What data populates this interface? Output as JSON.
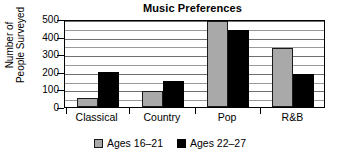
{
  "chart_data": {
    "type": "bar",
    "title": "Music Preferences",
    "xlabel": "",
    "ylabel": "Number of\nPeople Surveyed",
    "categories": [
      "Classical",
      "Country",
      "Pop",
      "R&B"
    ],
    "series": [
      {
        "name": "Ages 16–21",
        "color": "#a9a9a9",
        "values": [
          50,
          90,
          490,
          335
        ]
      },
      {
        "name": "Ages 22–27",
        "color": "#000000",
        "values": [
          200,
          145,
          440,
          185
        ]
      }
    ],
    "ylim": [
      0,
      500
    ],
    "ytick_labels": [
      "500",
      "400",
      "300",
      "200",
      "100",
      "0"
    ],
    "ytick_values": [
      500,
      400,
      300,
      200,
      100,
      0
    ],
    "minor_tick_step": 50,
    "grid": "horizontal",
    "legend_position": "bottom-center"
  },
  "legend": {
    "items": [
      {
        "label": "Ages 16–21"
      },
      {
        "label": "Ages 22–27"
      }
    ]
  }
}
